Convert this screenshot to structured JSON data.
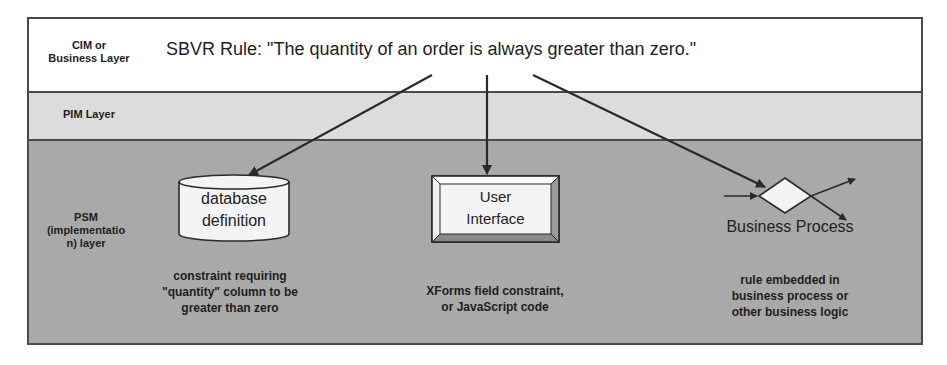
{
  "layers": {
    "cim": {
      "label_line1": "CIM or",
      "label_line2": "Business Layer",
      "fill": "#ffffff"
    },
    "pim": {
      "label": "PIM Layer",
      "fill": "#dcdcdc"
    },
    "psm": {
      "label_line1": "PSM",
      "label_line2": "(implementatio",
      "label_line3": "n) layer",
      "fill": "#a9a9a9"
    }
  },
  "rule": {
    "text": "SBVR Rule: \"The quantity of an order is always greater than zero.\""
  },
  "nodes": {
    "database": {
      "line1": "database",
      "line2": "definition",
      "shape": "cylinder"
    },
    "user_interface": {
      "line1": "User",
      "line2": "Interface",
      "shape": "beveled-rectangle"
    },
    "business_process": {
      "label": "Business Process",
      "shape": "diamond"
    }
  },
  "descriptions": {
    "database": {
      "line1": "constraint requiring",
      "line2": "\"quantity\" column to be",
      "line3": "greater than zero"
    },
    "user_interface": {
      "line1": "XForms field constraint,",
      "line2": "or JavaScript code"
    },
    "business_process": {
      "line1": "rule embedded in",
      "line2": "business process or",
      "line3": "other business logic"
    }
  },
  "edges": [
    {
      "from": "rule",
      "to": "database"
    },
    {
      "from": "rule",
      "to": "user_interface"
    },
    {
      "from": "rule",
      "to": "business_process"
    }
  ],
  "colors": {
    "border": "#4a4a4a",
    "arrow": "#2a2a2a",
    "shape_fill": "#f4f4f4"
  }
}
